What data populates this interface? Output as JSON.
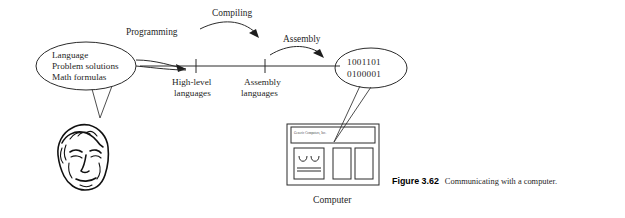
{
  "figure": {
    "caption_label": "Figure 3.62",
    "caption_text": "Communicating with a computer."
  },
  "diagram": {
    "human_ellipse": {
      "lines": [
        "Language",
        "Problem solutions",
        "Math formulas"
      ]
    },
    "machine_ellipse": {
      "lines": [
        "1001101",
        "0100001"
      ]
    },
    "axis_ticks": [
      {
        "label_line1": "High-level",
        "label_line2": "languages"
      },
      {
        "label_line1": "Assembly",
        "label_line2": "languages"
      }
    ],
    "arrows": [
      {
        "label": "Programming"
      },
      {
        "label": "Compiling"
      },
      {
        "label": "Assembly"
      }
    ],
    "computer": {
      "brand": "Generic Computers, Inc.",
      "label": "Computer"
    },
    "person": {
      "alt": "head of a person"
    }
  },
  "colors": {
    "ink": "#1f1f1f",
    "line": "#2b2b2b",
    "background": "#ffffff"
  }
}
